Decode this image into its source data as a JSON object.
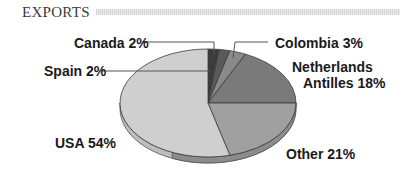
{
  "title": "EXPORTS",
  "chart_data": {
    "type": "pie",
    "title": "EXPORTS",
    "start_angle_deg": 0,
    "direction": "clockwise",
    "slices": [
      {
        "label": "Spain",
        "value": 2,
        "display": "Spain 2%",
        "color": "#3c3c3c"
      },
      {
        "label": "Canada",
        "value": 2,
        "display": "Canada 2%",
        "color": "#5a5a5a"
      },
      {
        "label": "Colombia",
        "value": 3,
        "display": "Colombia 3%",
        "color": "#8a8a8a"
      },
      {
        "label": "Netherlands Antilles",
        "value": 18,
        "display": "Netherlands Antilles 18%",
        "color": "#7a7a7a"
      },
      {
        "label": "Other",
        "value": 21,
        "display": "Other 21%",
        "color": "#a0a0a0"
      },
      {
        "label": "USA",
        "value": 54,
        "display": "USA 54%",
        "color": "#cfcfcf"
      }
    ],
    "style": "3d-tilted"
  },
  "labels": {
    "canada": "Canada 2%",
    "spain": "Spain 2%",
    "colombia": "Colombia 3%",
    "netherlands_line1": "Netherlands",
    "netherlands_line2": "Antilles 18%",
    "usa": "USA 54%",
    "other": "Other 21%"
  }
}
